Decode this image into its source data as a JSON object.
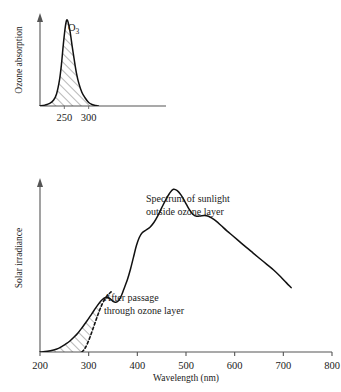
{
  "figure": {
    "background": "#ffffff",
    "ink_color": "#111111",
    "axis_color": "#555555"
  },
  "chart_data": [
    {
      "type": "area",
      "id": "ozone-absorption",
      "title": "",
      "xlabel": "",
      "ylabel": "Ozone absorption",
      "series_label": "O3",
      "series_label_display": "O",
      "series_label_subscript": "3",
      "xlim": [
        200,
        800
      ],
      "ylim": [
        0,
        1
      ],
      "xticks": [
        250,
        300
      ],
      "xtick_labels": [
        "250",
        "300"
      ],
      "yticks": [],
      "grid": false,
      "legend": "none",
      "fill_pattern": "diagonal-hatch",
      "x": [
        200,
        210,
        220,
        228,
        234,
        240,
        244,
        248,
        252,
        255,
        258,
        262,
        266,
        270,
        275,
        280,
        286,
        292,
        300,
        308,
        315,
        320
      ],
      "values": [
        0.0,
        0.01,
        0.03,
        0.07,
        0.14,
        0.3,
        0.48,
        0.72,
        0.92,
        1.0,
        0.97,
        0.86,
        0.7,
        0.55,
        0.38,
        0.26,
        0.16,
        0.1,
        0.04,
        0.015,
        0.005,
        0.0
      ]
    },
    {
      "type": "line",
      "id": "solar-irradiance",
      "title": "",
      "xlabel": "Wavelength (nm)",
      "ylabel": "Solar irradiance",
      "xlim": [
        200,
        800
      ],
      "ylim": [
        0,
        1
      ],
      "xticks": [
        200,
        300,
        400,
        500,
        600,
        700,
        800
      ],
      "xtick_labels": [
        "200",
        "300",
        "400",
        "500",
        "600",
        "700",
        "800"
      ],
      "yticks": [],
      "grid": false,
      "legend": "none",
      "fill_pattern": "diagonal-hatch",
      "series": [
        {
          "name": "Spectrum of sunlight outside ozone layer",
          "style": "solid",
          "x": [
            200,
            215,
            228,
            238,
            246,
            254,
            262,
            270,
            278,
            286,
            296,
            306,
            316,
            326,
            336,
            344,
            350,
            356,
            362,
            368,
            374,
            380,
            386,
            392,
            398,
            404,
            410,
            418,
            426,
            434,
            442,
            450,
            458,
            466,
            474,
            482,
            490,
            498,
            506,
            514,
            522,
            530,
            538,
            546,
            554,
            562,
            572,
            584,
            596,
            610,
            624,
            638,
            652,
            666,
            680,
            694,
            706,
            716
          ],
          "values": [
            0.0,
            0.004,
            0.012,
            0.022,
            0.035,
            0.05,
            0.068,
            0.09,
            0.115,
            0.145,
            0.185,
            0.228,
            0.272,
            0.31,
            0.33,
            0.322,
            0.305,
            0.3,
            0.312,
            0.345,
            0.392,
            0.44,
            0.5,
            0.57,
            0.64,
            0.69,
            0.718,
            0.735,
            0.752,
            0.78,
            0.82,
            0.868,
            0.915,
            0.955,
            0.98,
            0.972,
            0.945,
            0.905,
            0.862,
            0.83,
            0.818,
            0.82,
            0.822,
            0.818,
            0.805,
            0.788,
            0.762,
            0.73,
            0.7,
            0.665,
            0.63,
            0.596,
            0.562,
            0.528,
            0.494,
            0.455,
            0.418,
            0.388
          ]
        },
        {
          "name": "After passage through ozone layer",
          "style": "dashed",
          "x": [
            286,
            292,
            298,
            304,
            310,
            316,
            322,
            328,
            334,
            340,
            346
          ],
          "values": [
            0.0,
            0.02,
            0.055,
            0.1,
            0.15,
            0.2,
            0.248,
            0.29,
            0.322,
            0.345,
            0.362
          ]
        }
      ],
      "annotations": [
        {
          "id": "annotation-outside-ozone",
          "lines": [
            "Spectrum of sunlight",
            "outside ozone layer"
          ]
        },
        {
          "id": "annotation-after-passage",
          "lines": [
            "After passage",
            "through ozone layer"
          ]
        }
      ]
    }
  ]
}
